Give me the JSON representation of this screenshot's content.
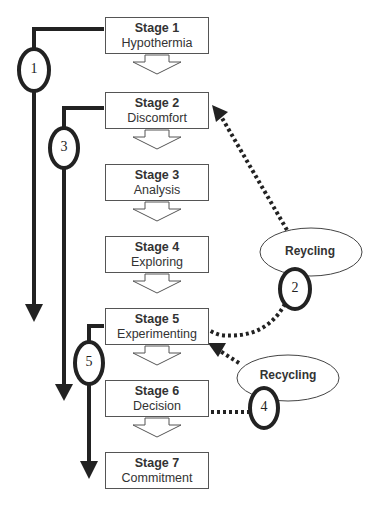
{
  "stages": [
    {
      "title": "Stage 1",
      "name": "Hypothermia"
    },
    {
      "title": "Stage 2",
      "name": "Discomfort"
    },
    {
      "title": "Stage 3",
      "name": "Analysis"
    },
    {
      "title": "Stage 4",
      "name": "Exploring"
    },
    {
      "title": "Stage 5",
      "name": "Experimenting"
    },
    {
      "title": "Stage 6",
      "name": "Decision"
    },
    {
      "title": "Stage 7",
      "name": "Commitment"
    }
  ],
  "paths": [
    {
      "number": "1"
    },
    {
      "number": "3"
    },
    {
      "number": "5"
    },
    {
      "number": "2"
    },
    {
      "number": "4"
    }
  ],
  "cycles": [
    {
      "label": "Reycling"
    },
    {
      "label": "Recycling"
    }
  ]
}
